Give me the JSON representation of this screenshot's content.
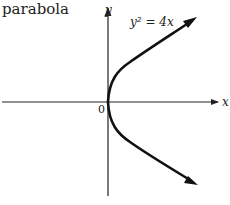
{
  "caption": "parabola",
  "diagram": {
    "equation": "y² = 4x",
    "x_axis_label": "x",
    "y_axis_label": "y",
    "origin_label": "0",
    "curve": "parabola opening right, vertex at origin"
  }
}
